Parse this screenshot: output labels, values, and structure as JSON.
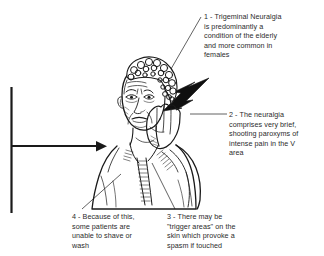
{
  "figure": {
    "background_color": "#ffffff",
    "ink_color": "#1a1a1a",
    "text_color": "#2b2b2b"
  },
  "callouts": [
    {
      "id": "1",
      "text": "1 - Trigeminal Neuralgia\nis predominantly a\ncondition of the elderly\nand more common in\nfemales"
    },
    {
      "id": "2",
      "text": "2 - The neuralgia\ncomprises very brief,\nshooting paroxyms of\nintense pain in the V\narea"
    },
    {
      "id": "3",
      "text": "3 - There may be\n\"trigger areas\" on the\nskin which provoke a\nspasm if touched"
    },
    {
      "id": "4",
      "text": "4 - Because of this,\nsome patients are\nunable to shave or\nwash"
    }
  ],
  "symbols": {
    "axis_arrow": "horizontal-arrow-right",
    "pain_bolt": "lightning-bolt"
  }
}
